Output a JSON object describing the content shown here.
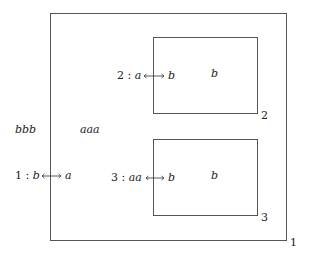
{
  "diagram": {
    "outer_box": {
      "id": "1",
      "label": "1"
    },
    "inner_boxes": [
      {
        "id": "2",
        "label": "2",
        "content": "b"
      },
      {
        "id": "3",
        "label": "3",
        "content": "b"
      }
    ],
    "free_text": {
      "left": "bbb",
      "center": "aaa"
    },
    "links": [
      {
        "index": "1 :",
        "from": "b",
        "to": "a"
      },
      {
        "index": "2 :",
        "from": "a",
        "to": "b"
      },
      {
        "index": "3 :",
        "from": "aa",
        "to": "b"
      }
    ]
  }
}
